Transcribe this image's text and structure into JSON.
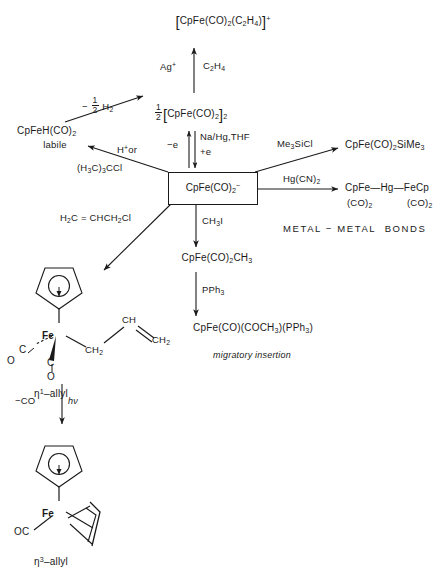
{
  "diagram": {
    "title_caption": "METAL − METAL  BONDS",
    "center": {
      "species": "CpFe(CO)2−",
      "label": "CpFe(CO)2-"
    },
    "nodes": {
      "ethylene_cation": "[CpFe(CO)2(C2H4)]+",
      "dimer": "1/2 [CpFe(CO)2]2",
      "hydride": "CpFeH(CO)2",
      "hydride_note": "labile",
      "silyl": "CpFe(CO)2SiMe3",
      "mercury_top": "CpFe—Hg—FeCp",
      "mercury_left_sub": "(CO)2",
      "mercury_right_sub": "(CO)2",
      "methyl": "CpFe(CO)2CH3",
      "acyl": "CpFe(CO)(COCH3)(PPh3)",
      "acyl_note": "migratory insertion",
      "eta1_label": "η1-allyl",
      "eta3_label": "η3-allyl"
    },
    "reagents": {
      "silver": "Ag+",
      "ethylene": "C2H4",
      "minus_half_h2": "- 1/2 H2",
      "minus_e": "−e",
      "plus_e": "+e",
      "na_hg_thf": "Na/Hg,THF",
      "proton_or": "H+ or",
      "tbucl": "(H3C)3CCl",
      "me3sicl": "Me3SiCl",
      "hg_cn_2": "Hg(CN)2",
      "allyl_chloride": "H2C = CHCH2Cl",
      "methyl_iodide": "CH3I",
      "pph3": "PPh3",
      "minus_co": "−CO",
      "h_nu": "hν"
    },
    "structure_atoms": {
      "fe": "Fe",
      "c": "C",
      "o": "O",
      "ch2": "CH2",
      "ch": "CH",
      "oc": "OC"
    },
    "colors": {
      "ink": "#1a1a1a",
      "paper": "#ffffff"
    }
  }
}
